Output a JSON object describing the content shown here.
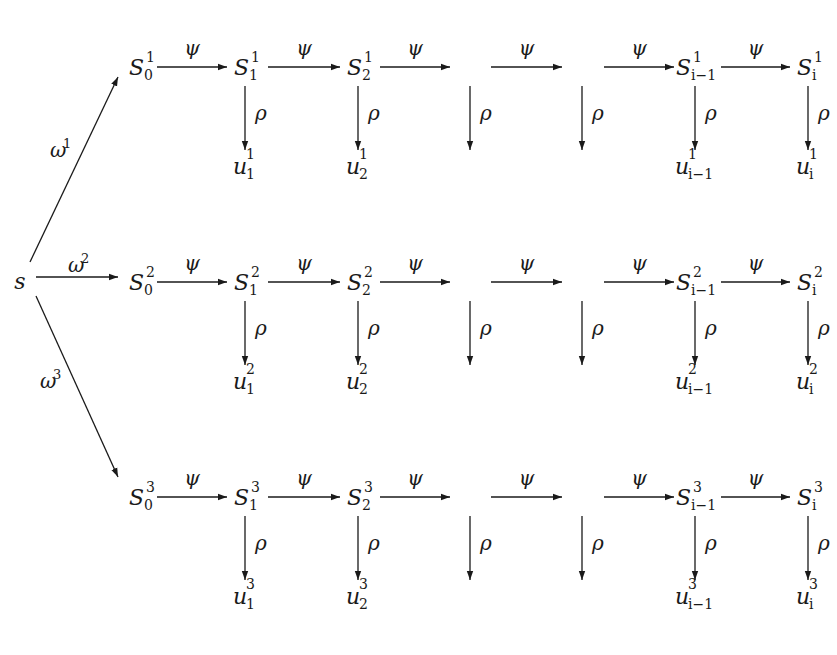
{
  "diagram": {
    "title": "",
    "source_node": {
      "label": "s",
      "x": 20,
      "y": 282
    },
    "branch_labels": [
      {
        "greek": "ω",
        "sup": "1",
        "x": 50,
        "y": 157
      },
      {
        "greek": "ω",
        "sup": "2",
        "x": 68,
        "y": 272
      },
      {
        "greek": "ω",
        "sup": "3",
        "x": 40,
        "y": 388
      }
    ],
    "branch_arrows": [
      {
        "x1": 30,
        "y1": 262,
        "x2": 118,
        "y2": 77
      },
      {
        "x1": 36,
        "y1": 277,
        "x2": 118,
        "y2": 277
      },
      {
        "x1": 36,
        "y1": 296,
        "x2": 118,
        "y2": 477
      }
    ],
    "column_x": [
      140,
      245,
      358,
      470,
      582,
      695,
      808
    ],
    "rows": [
      {
        "index": "1",
        "y": 67,
        "nodes": [
          "S_0",
          "S_1",
          "S_2",
          "",
          "",
          "S_{i-1}",
          "S_i"
        ],
        "outputs": [
          "",
          "u_1",
          "u_2",
          "",
          "",
          "u_{i-1}",
          "u_i"
        ],
        "show_down_arrow": [
          false,
          true,
          true,
          true,
          true,
          true,
          true
        ]
      },
      {
        "index": "2",
        "y": 282,
        "nodes": [
          "S_0",
          "S_1",
          "S_2",
          "",
          "",
          "S_{i-1}",
          "S_i"
        ],
        "outputs": [
          "",
          "u_1",
          "u_2",
          "",
          "",
          "u_{i-1}",
          "u_i"
        ],
        "show_down_arrow": [
          false,
          true,
          true,
          true,
          true,
          true,
          true
        ]
      },
      {
        "index": "3",
        "y": 497,
        "nodes": [
          "S_0",
          "S_1",
          "S_2",
          "",
          "",
          "S_{i-1}",
          "S_i"
        ],
        "outputs": [
          "",
          "u_1",
          "u_2",
          "",
          "",
          "u_{i-1}",
          "u_i"
        ],
        "show_down_arrow": [
          false,
          true,
          true,
          true,
          true,
          true,
          true
        ]
      }
    ],
    "transition_label": "ψ",
    "readout_label": "ρ",
    "horizontal_arrow_spans": [
      [
        157,
        227
      ],
      [
        268,
        340
      ],
      [
        380,
        450
      ],
      [
        491,
        562
      ],
      [
        604,
        674
      ],
      [
        721,
        790
      ]
    ],
    "colors": {
      "ink": "#1a1a1a",
      "background": "#ffffff"
    }
  }
}
